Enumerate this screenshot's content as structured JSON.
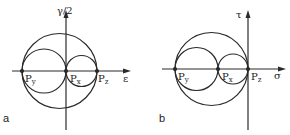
{
  "figure": {
    "panels": [
      {
        "id": "a",
        "panel_label": "a",
        "y_axis_label": "γ/2",
        "x_axis_label": "ε",
        "points": [
          {
            "name": "P",
            "sub": "y"
          },
          {
            "name": "P",
            "sub": "x"
          },
          {
            "name": "P",
            "sub": "z"
          }
        ],
        "description": "Mohr circles for strain"
      },
      {
        "id": "b",
        "panel_label": "b",
        "y_axis_label": "τ",
        "x_axis_label": "σ",
        "points": [
          {
            "name": "P",
            "sub": "y"
          },
          {
            "name": "P",
            "sub": "x"
          },
          {
            "name": "P",
            "sub": "z"
          }
        ],
        "description": "Mohr circles for stress"
      }
    ],
    "colors": {
      "line": "#2a2a2a",
      "background": "#ffffff"
    }
  }
}
